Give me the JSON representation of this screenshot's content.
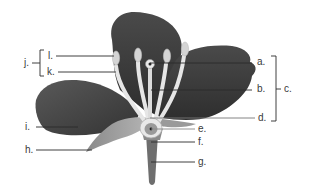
{
  "diagram": {
    "colors": {
      "petal_dark": "#3c3c3c",
      "petal_mid": "#5a5a5a",
      "stamen": "#e4e4e4",
      "anther": "#cfcfcf",
      "pistil": "#d8d8d8",
      "stem": "#6e6e6e",
      "line": "#2a2a2a",
      "label": "#3a3a3a"
    },
    "labels": {
      "a": "a.",
      "b": "b.",
      "c": "c.",
      "d": "d.",
      "e": "e.",
      "f": "f.",
      "g": "g.",
      "h": "h.",
      "i": "i.",
      "j": "j.",
      "k": "k.",
      "l": "l."
    }
  }
}
